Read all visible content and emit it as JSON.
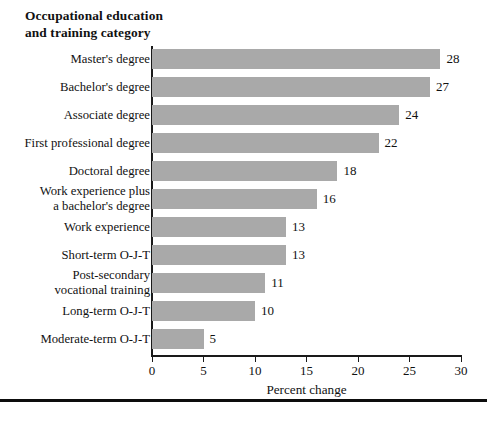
{
  "chart_data": {
    "type": "bar",
    "orientation": "horizontal",
    "title": "Occupational education\nand training category",
    "xlabel": "Percent change",
    "ylabel": "",
    "xlim": [
      0,
      30
    ],
    "xticks": [
      0,
      5,
      10,
      15,
      20,
      25,
      30
    ],
    "xtick_labels": [
      "0",
      "5",
      "10",
      "15",
      "20",
      "25",
      "30"
    ],
    "grid": false,
    "legend": null,
    "bar_color": "#a9a9a9",
    "categories": [
      "Master's degree",
      "Bachelor's degree",
      "Associate degree",
      "First professional degree",
      "Doctoral degree",
      "Work experience plus\na bachelor's degree",
      "Work experience",
      "Short-term O-J-T",
      "Post-secondary\nvocational training",
      "Long-term O-J-T",
      "Moderate-term O-J-T"
    ],
    "values": [
      28,
      27,
      24,
      22,
      18,
      16,
      13,
      13,
      11,
      10,
      5
    ],
    "value_labels": [
      "28",
      "27",
      "24",
      "22",
      "18",
      "16",
      "13",
      "13",
      "11",
      "10",
      "5"
    ]
  }
}
